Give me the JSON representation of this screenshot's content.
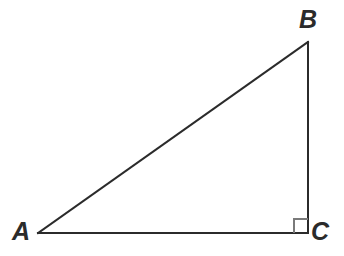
{
  "figure": {
    "type": "right-triangle-diagram",
    "background_color": "#ffffff",
    "stroke_color": "#2b2b2b",
    "right_angle_mark_color": "#7a7a7a",
    "stroke_width": 2,
    "canvas": {
      "width": 344,
      "height": 256
    },
    "vertices": [
      {
        "name": "A",
        "label": "A",
        "x": 38,
        "y": 233,
        "label_x": 12,
        "label_y": 219
      },
      {
        "name": "B",
        "label": "B",
        "x": 308,
        "y": 42,
        "label_x": 299,
        "label_y": 7
      },
      {
        "name": "C",
        "label": "C",
        "x": 308,
        "y": 233,
        "label_x": 311,
        "label_y": 219
      }
    ],
    "sides": [
      {
        "name": "AB",
        "role": "hypotenuse",
        "from": "A",
        "to": "B"
      },
      {
        "name": "BC",
        "role": "vertical-leg",
        "from": "B",
        "to": "C"
      },
      {
        "name": "AC",
        "role": "horizontal-leg",
        "from": "A",
        "to": "C"
      }
    ],
    "right_angle_mark": {
      "at_vertex": "C",
      "size": 14,
      "x": 294,
      "y": 219
    }
  }
}
